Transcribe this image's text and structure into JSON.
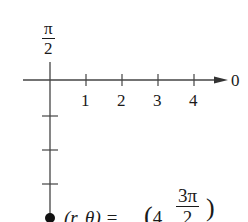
{
  "diagram": {
    "type": "polar-coordinate-plot",
    "polar_axis_label": "0",
    "vertical_axis_label": {
      "numerator": "π",
      "denominator": "2"
    },
    "tick_labels": [
      "1",
      "2",
      "3",
      "4"
    ],
    "point": {
      "label_prefix": "(r, θ) = ",
      "r": "4",
      "theta_numerator": "3π",
      "theta_denominator": "2"
    }
  },
  "colors": {
    "ink": "#1a1a1a",
    "background": "#ffffff"
  }
}
